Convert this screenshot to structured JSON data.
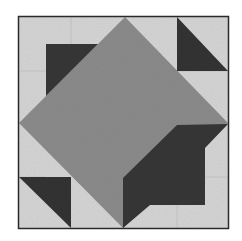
{
  "image": {
    "subject": "quilt block",
    "description": "Square quilt block with a medium-gray central diamond, two dark stepped pieces at top-left and bottom-right, and two dark half-square triangles at top-right and bottom-left on a light background"
  },
  "colors": {
    "background": "#ffffff",
    "light_fabric": "#d6d6d6",
    "medium_fabric": "#8c8c8c",
    "dark_fabric": "#373737",
    "border": "#2a2a2a",
    "seam": "#bdbdbd"
  },
  "block": {
    "x": 18,
    "y": 16,
    "width": 211,
    "height": 213
  },
  "pieces": [
    {
      "name": "center-diamond",
      "fill": "medium_fabric",
      "points": "125,17 228,123 123,228 19,123"
    },
    {
      "name": "top-left-dark-piece",
      "fill": "dark_fabric",
      "points": "19,123 46,96 46,44 98,44 125,17 19,123"
    },
    {
      "name": "bottom-right-dark-piece",
      "fill": "dark_fabric",
      "points": "177,125 228,124 205,148 205,205 150,205 123,228 123,178"
    },
    {
      "name": "top-right-triangle",
      "fill": "dark_fabric",
      "points": "177,17 177,71 228,71"
    },
    {
      "name": "bottom-left-triangle",
      "fill": "dark_fabric",
      "points": "19,177 71,177 71,228"
    }
  ]
}
